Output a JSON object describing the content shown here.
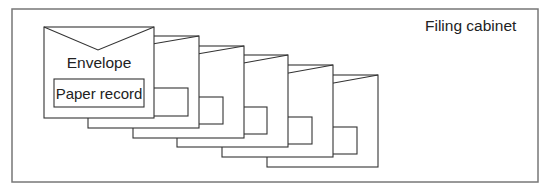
{
  "diagram": {
    "cabinet_label": "Filing cabinet",
    "envelope_label": "Envelope",
    "record_label": "Paper record",
    "envelope_count": 6,
    "colors": {
      "stroke": "#333333",
      "frame": "#777777",
      "text": "#222222",
      "background": "#ffffff"
    }
  }
}
